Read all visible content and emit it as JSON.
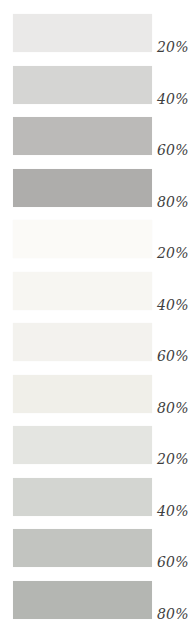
{
  "page": {
    "background": "#ffffff",
    "label_color": "#3f3f3f"
  },
  "swatches": [
    {
      "label": "20%",
      "color": "#eae9e8"
    },
    {
      "label": "40%",
      "color": "#d5d5d3"
    },
    {
      "label": "60%",
      "color": "#bbbab8"
    },
    {
      "label": "80%",
      "color": "#aeadab"
    },
    {
      "label": "20%",
      "color": "#fbfaf7"
    },
    {
      "label": "40%",
      "color": "#f7f6f2"
    },
    {
      "label": "60%",
      "color": "#f3f2ee"
    },
    {
      "label": "80%",
      "color": "#f0efe9"
    },
    {
      "label": "20%",
      "color": "#e4e5e1"
    },
    {
      "label": "40%",
      "color": "#d3d5d1"
    },
    {
      "label": "60%",
      "color": "#c2c4c0"
    },
    {
      "label": "80%",
      "color": "#b4b6b2"
    }
  ],
  "chart_data": {
    "type": "table",
    "title": "",
    "description_of_visual": "Vertical column of 12 rectangular tint swatches in three groups of four, each labeled with its tint percentage in italics at the bottom-right",
    "groups": [
      {
        "name": "neutral-gray-tints",
        "categories": [
          "20%",
          "40%",
          "60%",
          "80%"
        ],
        "values": [
          20,
          40,
          60,
          80
        ],
        "colors": [
          "#eae9e8",
          "#d5d5d3",
          "#bbbab8",
          "#aeadab"
        ]
      },
      {
        "name": "near-white-warm-tints",
        "categories": [
          "20%",
          "40%",
          "60%",
          "80%"
        ],
        "values": [
          20,
          40,
          60,
          80
        ],
        "colors": [
          "#fbfaf7",
          "#f7f6f2",
          "#f3f2ee",
          "#f0efe9"
        ]
      },
      {
        "name": "cool-gray-tints",
        "categories": [
          "20%",
          "40%",
          "60%",
          "80%"
        ],
        "values": [
          20,
          40,
          60,
          80
        ],
        "colors": [
          "#e4e5e1",
          "#d3d5d1",
          "#c2c4c0",
          "#b4b6b2"
        ]
      }
    ],
    "legend_position": "none",
    "grid": false
  }
}
